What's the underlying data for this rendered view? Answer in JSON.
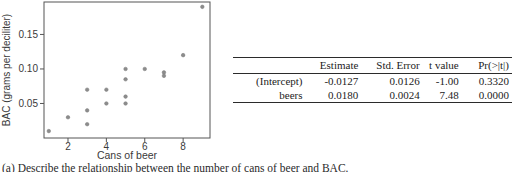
{
  "chart_data": {
    "type": "scatter",
    "title": "",
    "xlabel": "Cans of beer",
    "ylabel": "BAC (grams per deciliter)",
    "x": [
      1,
      2,
      3,
      3,
      3,
      4,
      4,
      5,
      5,
      5,
      5,
      6,
      7,
      7,
      8,
      9
    ],
    "y": [
      0.01,
      0.03,
      0.02,
      0.04,
      0.07,
      0.05,
      0.07,
      0.05,
      0.06,
      0.085,
      0.1,
      0.1,
      0.09,
      0.095,
      0.12,
      0.19
    ],
    "xticks": [
      2,
      4,
      6,
      8
    ],
    "xtick_labels": [
      "2",
      "4",
      "6",
      "8"
    ],
    "yticks": [
      0.05,
      0.1,
      0.15
    ],
    "ytick_labels": [
      "0.05",
      "0.10",
      "0.15"
    ],
    "xlim": [
      0.75,
      9.4
    ],
    "ylim": [
      0,
      0.197
    ],
    "grid": false,
    "legend": "none",
    "point_color": "#8c8c8c",
    "frame_color": "#555555",
    "axis_text_color": "#3a3a3a"
  },
  "table": {
    "headers": [
      "",
      "Estimate",
      "Std. Error",
      "t value",
      "Pr(>|t|)"
    ],
    "rows": [
      {
        "label": "(Intercept)",
        "estimate": "-0.0127",
        "std_error": "0.0126",
        "t_value": "-1.00",
        "p_value": "0.3320"
      },
      {
        "label": "beers",
        "estimate": "0.0180",
        "std_error": "0.0024",
        "t_value": "7.48",
        "p_value": "0.0000"
      }
    ]
  },
  "caption": "(a) Describe the relationship between the number of cans of beer and BAC."
}
